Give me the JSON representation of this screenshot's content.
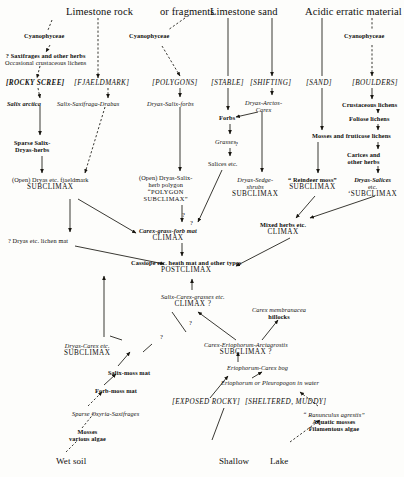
{
  "diagram": {
    "headers": [
      {
        "id": "limestone-rock",
        "label": "Limestone rock",
        "x": 66,
        "y": 6
      },
      {
        "id": "or-fragments",
        "label": "or fragments",
        "x": 160,
        "y": 6
      },
      {
        "id": "limestone-sand",
        "label": "Limestone sand",
        "x": 210,
        "y": 6
      },
      {
        "id": "acidic-erratic",
        "label": "Acidic erratic material",
        "x": 305,
        "y": 6
      }
    ],
    "brackets": [
      {
        "id": "rocky-scree",
        "label": "[ROCKY SCREE]",
        "x": 6,
        "y": 80,
        "bold": true
      },
      {
        "id": "fjaeldmark",
        "label": "[FJAELDMARK]",
        "x": 74,
        "y": 80,
        "bold": false
      },
      {
        "id": "polygons",
        "label": "[POLYGONS]",
        "x": 152,
        "y": 80,
        "bold": false
      },
      {
        "id": "stable",
        "label": "[STABLE]",
        "x": 211,
        "y": 80,
        "bold": false
      },
      {
        "id": "shifting",
        "label": "[SHIFTING]",
        "x": 250,
        "y": 80,
        "bold": false
      },
      {
        "id": "sand",
        "label": "[SAND]",
        "x": 306,
        "y": 80,
        "bold": false
      },
      {
        "id": "boulders",
        "label": "[BOULDERS]",
        "x": 352,
        "y": 80,
        "bold": false
      },
      {
        "id": "exposed-rocky",
        "label": "[EXPOSED  ROCKY]",
        "x": 172,
        "y": 399,
        "bold": false
      },
      {
        "id": "sheltered-muddy",
        "label": "[SHELTERED, MUDDY]",
        "x": 245,
        "y": 399,
        "bold": false
      }
    ],
    "nodes": [
      {
        "id": "cyanophyceae-1",
        "lines": [
          {
            "t": "Cyanophyceae",
            "s": "smb"
          }
        ],
        "x": 24,
        "y": 33
      },
      {
        "id": "cyanophyceae-2",
        "lines": [
          {
            "t": "Cyanophyceae",
            "s": "smb"
          }
        ],
        "x": 129,
        "y": 33
      },
      {
        "id": "cyanophyceae-3",
        "lines": [
          {
            "t": "Cyanophyceae",
            "s": "smb"
          }
        ],
        "x": 344,
        "y": 33
      },
      {
        "id": "saxifrages-herbs",
        "lines": [
          {
            "t": "? Saxifrages   and   other herbs",
            "s": "smb"
          },
          {
            "t": "Occasional crustaceous lichens",
            "s": "sm"
          }
        ],
        "x": 5,
        "y": 53
      },
      {
        "id": "salix-arctica",
        "lines": [
          {
            "t": "Salix arctica",
            "s": "itb"
          }
        ],
        "x": 7,
        "y": 101
      },
      {
        "id": "salix-saxifraga-drabas",
        "lines": [
          {
            "t": "Salix-Saxifraga-Drabas",
            "s": "it"
          }
        ],
        "x": 57,
        "y": 101
      },
      {
        "id": "dryas-salix-forbs",
        "lines": [
          {
            "t": "Dryas-Salix-forbs",
            "s": "it"
          }
        ],
        "x": 147,
        "y": 101
      },
      {
        "id": "dryas-arctos-carex",
        "lines": [
          {
            "t": "Dryas-Arctos-",
            "s": "it"
          },
          {
            "t": "Carex",
            "s": "it"
          }
        ],
        "x": 245,
        "y": 100
      },
      {
        "id": "crustaceous-lichens",
        "lines": [
          {
            "t": "Crustaceous lichens",
            "s": "smb"
          }
        ],
        "x": 342,
        "y": 102
      },
      {
        "id": "sparse-salix-dryas",
        "lines": [
          {
            "t": "Sparse Salix-",
            "s": "smb"
          },
          {
            "t": "Dryas-herbs",
            "s": "smb"
          }
        ],
        "x": 14,
        "y": 140
      },
      {
        "id": "forbs",
        "lines": [
          {
            "t": "Forbs",
            "s": "smb"
          }
        ],
        "x": 219,
        "y": 115
      },
      {
        "id": "grasses",
        "lines": [
          {
            "t": "Grasses",
            "s": "it"
          }
        ],
        "x": 215,
        "y": 139
      },
      {
        "id": "salices-etc",
        "lines": [
          {
            "t": "Salices etc.",
            "s": "sm"
          }
        ],
        "x": 208,
        "y": 161
      },
      {
        "id": "foliose-lichens",
        "lines": [
          {
            "t": "Foliose lichens",
            "s": "smb"
          }
        ],
        "x": 349,
        "y": 116
      },
      {
        "id": "mosses-fruticose",
        "lines": [
          {
            "t": "Mosses and fruticose lichens",
            "s": "smb"
          }
        ],
        "x": 312,
        "y": 133
      },
      {
        "id": "carices-herbs",
        "lines": [
          {
            "t": "Carices and",
            "s": "smb"
          },
          {
            "t": "other herbs",
            "s": "smb"
          }
        ],
        "x": 347,
        "y": 152
      },
      {
        "id": "open-dryas-fjaeldmark",
        "lines": [
          {
            "t": "(Open) Dryas etc. fjaeldmark",
            "s": "sm"
          },
          {
            "t": "SUBCLIMAX",
            "s": "cap"
          }
        ],
        "x": 12,
        "y": 177
      },
      {
        "id": "open-dryas-polygon",
        "lines": [
          {
            "t": "(Open) Dryas-Salix-",
            "s": "sm"
          },
          {
            "t": "herb   polygon",
            "s": "sm"
          },
          {
            "t": "“POLYGON",
            "s": "capsm"
          },
          {
            "t": "SUBCLIMAX”",
            "s": "capsm"
          }
        ],
        "x": 139,
        "y": 175
      },
      {
        "id": "dryas-sedge-shrubs",
        "lines": [
          {
            "t": "Dryas-Sedge-",
            "s": "it"
          },
          {
            "t": "shrubs",
            "s": "it"
          },
          {
            "t": "SUBCLIMAX",
            "s": "cap"
          }
        ],
        "x": 232,
        "y": 177
      },
      {
        "id": "reindeer-moss",
        "lines": [
          {
            "t": "“ Reindeer moss”",
            "s": "smb"
          },
          {
            "t": "SUBCLIMAX",
            "s": "cap"
          }
        ],
        "x": 288,
        "y": 177
      },
      {
        "id": "dryas-salices-subclimax",
        "lines": [
          {
            "t": "Dryas-Salices",
            "s": "itb"
          },
          {
            "t": "etc.",
            "s": "sm"
          },
          {
            "t": "‘SUBCLIMAX",
            "s": "cap"
          }
        ],
        "x": 348,
        "y": 177
      },
      {
        "id": "carex-grass-forb-mat",
        "lines": [
          {
            "t": "Carex-grass-forb mat",
            "s": "itb"
          },
          {
            "t": "CLIMAX",
            "s": "cap"
          }
        ],
        "x": 139,
        "y": 228
      },
      {
        "id": "dryas-lichen-mat",
        "lines": [
          {
            "t": "? Dryas etc. lichen mat",
            "s": "sm"
          }
        ],
        "x": 8,
        "y": 238
      },
      {
        "id": "mixed-herbs-climax",
        "lines": [
          {
            "t": "Mixed herbs etc.",
            "s": "smb"
          },
          {
            "t": "CLIMAX",
            "s": "cap"
          }
        ],
        "x": 260,
        "y": 222
      },
      {
        "id": "cassiope-postclimax",
        "lines": [
          {
            "t": "Cassiope etc. heath mat and other types",
            "s": "smb"
          },
          {
            "t": "POSTCLIMAX",
            "s": "cap"
          }
        ],
        "x": 131,
        "y": 260
      },
      {
        "id": "salix-carex-grasses",
        "lines": [
          {
            "t": "Salix-Carex-grasses etc.",
            "s": "it"
          },
          {
            "t": "CLIMAX ?",
            "s": "cap"
          }
        ],
        "x": 161,
        "y": 294
      },
      {
        "id": "carex-membranacea",
        "lines": [
          {
            "t": "Carex membranacea",
            "s": "it"
          },
          {
            "t": "hillocks",
            "s": "smb"
          }
        ],
        "x": 252,
        "y": 307
      },
      {
        "id": "dryas-carex-subclimax",
        "lines": [
          {
            "t": "Dryas-Carex etc.",
            "s": "it"
          },
          {
            "t": "SUBCLIMAX",
            "s": "cap"
          }
        ],
        "x": 64,
        "y": 343
      },
      {
        "id": "carex-eriophorum-arcta",
        "lines": [
          {
            "t": "Carex-Eriophorum-Arctagrostis",
            "s": "it"
          },
          {
            "t": "SUBCLIMAX ?",
            "s": "cap"
          }
        ],
        "x": 204,
        "y": 342
      },
      {
        "id": "salix-moss-mat",
        "lines": [
          {
            "t": "Salix-moss mat",
            "s": "smb"
          }
        ],
        "x": 108,
        "y": 370
      },
      {
        "id": "eriophorum-carex-bog",
        "lines": [
          {
            "t": "Eriophorum-Carex bog",
            "s": "it"
          },
          {
            "t": "",
            "s": "sm"
          }
        ],
        "x": 227,
        "y": 365
      },
      {
        "id": "forb-moss-mat",
        "lines": [
          {
            "t": "Forb-moss mat",
            "s": "smb"
          }
        ],
        "x": 95,
        "y": 388
      },
      {
        "id": "eriophorum-pleuropogon",
        "lines": [
          {
            "t": "Eriophorum or Pleuropogon in water",
            "s": "it"
          }
        ],
        "x": 221,
        "y": 380
      },
      {
        "id": "sparse-oxyria",
        "lines": [
          {
            "t": "Sparse Oxyria-Saxifrages",
            "s": "it"
          },
          {
            "t": "",
            "s": "sm"
          }
        ],
        "x": 72,
        "y": 411
      },
      {
        "id": "mosses-algae",
        "lines": [
          {
            "t": "Mosses",
            "s": "smb"
          },
          {
            "t": "various algae",
            "s": "smb"
          }
        ],
        "x": 69,
        "y": 429
      },
      {
        "id": "ranunculus-group",
        "lines": [
          {
            "t": "“ Ranunculus agrestis”",
            "s": "it"
          },
          {
            "t": "Aquatic mosses",
            "s": "smb"
          },
          {
            "t": "Filamentous algae",
            "s": "smb"
          }
        ],
        "x": 303,
        "y": 412
      },
      {
        "id": "wet-soil",
        "lines": [
          {
            "t": "Wet soil",
            "s": "base"
          }
        ],
        "x": 56,
        "y": 457
      },
      {
        "id": "shallow",
        "lines": [
          {
            "t": "Shallow",
            "s": "base"
          }
        ],
        "x": 219,
        "y": 457
      },
      {
        "id": "lake",
        "lines": [
          {
            "t": "Lake",
            "s": "base"
          }
        ],
        "x": 270,
        "y": 457
      }
    ],
    "question_marks": [
      {
        "id": "q-stable-shift",
        "label": "?",
        "x": 235,
        "y": 140
      },
      {
        "id": "q-polygon",
        "label": "?",
        "x": 182,
        "y": 211
      },
      {
        "id": "q-carex-grass",
        "label": "?",
        "x": 190,
        "y": 219
      },
      {
        "id": "q-climax-link",
        "label": "?",
        "x": 189,
        "y": 319
      },
      {
        "id": "q-dryas-carex",
        "label": "?",
        "x": 160,
        "y": 333
      }
    ]
  }
}
